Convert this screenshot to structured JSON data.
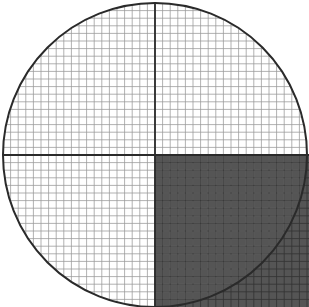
{
  "diagram": {
    "title": "Circle on grid with shaded quadrant square",
    "canvas": {
      "width": 309,
      "height": 307
    },
    "grid": {
      "x0": 3,
      "y0": 3,
      "x1": 309,
      "y1": 307,
      "cell": 7.6,
      "minor_color": "#9a9a9a",
      "axis_x": 155,
      "axis_y": 155,
      "axis_color": "#2a2a2a"
    },
    "circle": {
      "cx": 155,
      "cy": 155,
      "r": 152,
      "stroke": "#2a2a2a",
      "stroke_width": 2
    },
    "shaded_square": {
      "x": 155,
      "y": 155,
      "width": 154,
      "height": 152,
      "fill": "#555555"
    },
    "colors": {
      "background": "#ffffff",
      "shade": "#555555",
      "line": "#2a2a2a"
    }
  }
}
